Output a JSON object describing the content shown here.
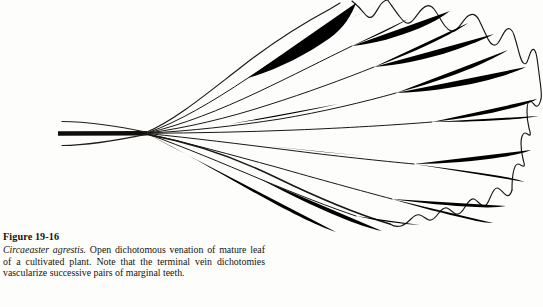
{
  "figure": {
    "label": "Figure 19-16",
    "species_name": "Circaeaster agrestis.",
    "caption_text": " Open dichotomous venation of mature leaf of a cultivated plant. Note that the terminal vein dichotomies vascularize successive pairs of marginal teeth.",
    "ink_color": "#1a1713",
    "background_color": "#fdfdfc"
  },
  "illustration": {
    "title": "open dichotomous leaf venation",
    "petiole_label": "petiole",
    "blade_label": "leaf blade",
    "margin_label": "serrate margin with teeth",
    "vein_label": "dichotomously branching vein"
  }
}
